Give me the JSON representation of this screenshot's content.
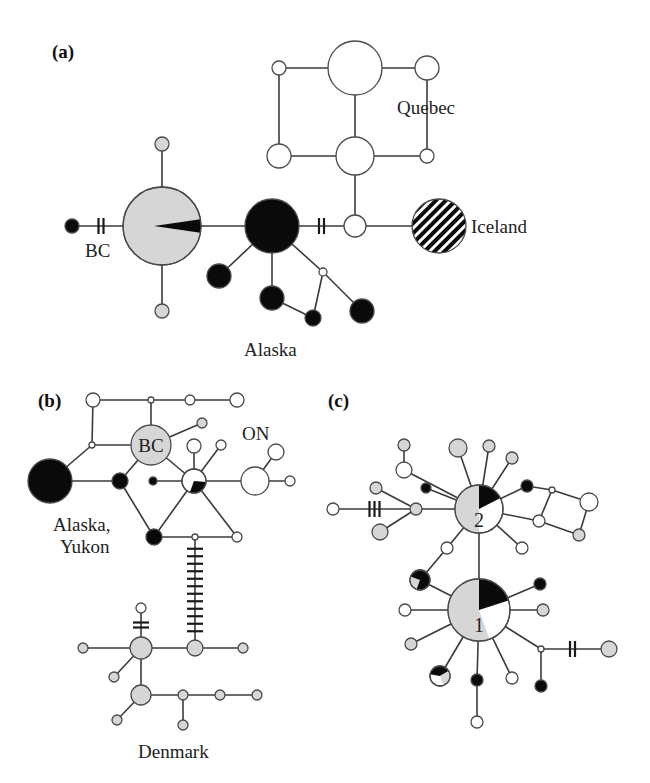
{
  "colors": {
    "white": "#ffffff",
    "gray": "#d6d6d6",
    "black": "#0a0a0a"
  },
  "panels": [
    {
      "id": "a",
      "label": "(a)",
      "region_labels": [
        "BC",
        "Quebec",
        "Iceland",
        "Alaska"
      ],
      "nodes": [
        {
          "id": "a1",
          "x": 162,
          "y": 226,
          "r": 39,
          "fill": "gray",
          "pie": [
            {
              "from": 80,
              "to": 100,
              "fill": "black",
              "inner": true
            }
          ]
        },
        {
          "id": "a2",
          "x": 72,
          "y": 226,
          "r": 7,
          "fill": "black"
        },
        {
          "id": "a3",
          "x": 162,
          "y": 144,
          "r": 7,
          "fill": "gray"
        },
        {
          "id": "a4",
          "x": 162,
          "y": 311,
          "r": 7,
          "fill": "gray"
        },
        {
          "id": "a5",
          "x": 272,
          "y": 226,
          "r": 27,
          "fill": "black"
        },
        {
          "id": "a6",
          "x": 219,
          "y": 276,
          "r": 12,
          "fill": "black"
        },
        {
          "id": "a7",
          "x": 272,
          "y": 298,
          "r": 12,
          "fill": "black"
        },
        {
          "id": "a8",
          "x": 313,
          "y": 318,
          "r": 8,
          "fill": "black"
        },
        {
          "id": "a9",
          "x": 323,
          "y": 272,
          "r": 4,
          "fill": "white"
        },
        {
          "id": "a10",
          "x": 362,
          "y": 311,
          "r": 12,
          "fill": "black"
        },
        {
          "id": "a11",
          "x": 355,
          "y": 226,
          "r": 11,
          "fill": "white"
        },
        {
          "id": "a12",
          "x": 439,
          "y": 226,
          "r": 27,
          "fill": "hatch"
        },
        {
          "id": "a13",
          "x": 355,
          "y": 156,
          "r": 19,
          "fill": "white"
        },
        {
          "id": "a14",
          "x": 355,
          "y": 68,
          "r": 27,
          "fill": "white"
        },
        {
          "id": "a15",
          "x": 279,
          "y": 68,
          "r": 7,
          "fill": "white"
        },
        {
          "id": "a16",
          "x": 427,
          "y": 68,
          "r": 12,
          "fill": "white"
        },
        {
          "id": "a17",
          "x": 279,
          "y": 156,
          "r": 12,
          "fill": "white"
        },
        {
          "id": "a18",
          "x": 427,
          "y": 156,
          "r": 7,
          "fill": "white"
        }
      ],
      "edges": [
        [
          "a2",
          "a1",
          2
        ],
        [
          "a1",
          "a3",
          0
        ],
        [
          "a1",
          "a4",
          0
        ],
        [
          "a1",
          "a5",
          0
        ],
        [
          "a5",
          "a11",
          2
        ],
        [
          "a11",
          "a12",
          0
        ],
        [
          "a11",
          "a13",
          0
        ],
        [
          "a13",
          "a14",
          0
        ],
        [
          "a14",
          "a15",
          0
        ],
        [
          "a14",
          "a16",
          0
        ],
        [
          "a15",
          "a17",
          0
        ],
        [
          "a17",
          "a13",
          0
        ],
        [
          "a13",
          "a18",
          0
        ],
        [
          "a18",
          "a16",
          0
        ],
        [
          "a5",
          "a6",
          0
        ],
        [
          "a5",
          "a7",
          0
        ],
        [
          "a7",
          "a8",
          0
        ],
        [
          "a8",
          "a9",
          0
        ],
        [
          "a5",
          "a9",
          0
        ],
        [
          "a9",
          "a10",
          0
        ]
      ]
    },
    {
      "id": "b",
      "label": "(b)",
      "region_labels": [
        "BC",
        "ON",
        "Alaska,",
        "Yukon",
        "Denmark"
      ],
      "nodes": [
        {
          "id": "b1",
          "x": 151,
          "y": 445,
          "r": 20,
          "fill": "gray"
        },
        {
          "id": "b2",
          "x": 50,
          "y": 481,
          "r": 22,
          "fill": "black"
        },
        {
          "id": "b3",
          "x": 93,
          "y": 400,
          "r": 7,
          "fill": "white"
        },
        {
          "id": "b4",
          "x": 151,
          "y": 400,
          "r": 3,
          "fill": "white"
        },
        {
          "id": "b5",
          "x": 190,
          "y": 400,
          "r": 5,
          "fill": "white"
        },
        {
          "id": "b6",
          "x": 237,
          "y": 400,
          "r": 7,
          "fill": "white"
        },
        {
          "id": "b7",
          "x": 92,
          "y": 445,
          "r": 3,
          "fill": "white"
        },
        {
          "id": "b8",
          "x": 202,
          "y": 423,
          "r": 5,
          "fill": "gray"
        },
        {
          "id": "b9",
          "x": 120,
          "y": 481,
          "r": 8,
          "fill": "black"
        },
        {
          "id": "b10",
          "x": 153,
          "y": 481,
          "r": 4,
          "fill": "black"
        },
        {
          "id": "b11",
          "x": 194,
          "y": 481,
          "r": 12,
          "fill": "white",
          "pie": [
            {
              "from": 95,
              "to": 200,
              "fill": "black"
            }
          ]
        },
        {
          "id": "b12",
          "x": 194,
          "y": 446,
          "r": 7,
          "fill": "white"
        },
        {
          "id": "b13",
          "x": 221,
          "y": 445,
          "r": 5,
          "fill": "white"
        },
        {
          "id": "b14",
          "x": 255,
          "y": 481,
          "r": 14,
          "fill": "white"
        },
        {
          "id": "b15",
          "x": 276,
          "y": 452,
          "r": 8,
          "fill": "white"
        },
        {
          "id": "b16",
          "x": 290,
          "y": 481,
          "r": 5,
          "fill": "white"
        },
        {
          "id": "b17",
          "x": 154,
          "y": 537,
          "r": 8,
          "fill": "black"
        },
        {
          "id": "b18",
          "x": 195,
          "y": 537,
          "r": 3,
          "fill": "white"
        },
        {
          "id": "b19",
          "x": 237,
          "y": 537,
          "r": 5,
          "fill": "white"
        },
        {
          "id": "b20",
          "x": 195,
          "y": 648,
          "r": 8,
          "fill": "gray"
        },
        {
          "id": "b21",
          "x": 141,
          "y": 648,
          "r": 11,
          "fill": "gray"
        },
        {
          "id": "b22",
          "x": 141,
          "y": 608,
          "r": 5,
          "fill": "white"
        },
        {
          "id": "b23",
          "x": 83,
          "y": 648,
          "r": 5,
          "fill": "gray"
        },
        {
          "id": "b24",
          "x": 243,
          "y": 648,
          "r": 5,
          "fill": "gray"
        },
        {
          "id": "b25",
          "x": 114,
          "y": 677,
          "r": 5,
          "fill": "gray"
        },
        {
          "id": "b26",
          "x": 141,
          "y": 695,
          "r": 10,
          "fill": "gray"
        },
        {
          "id": "b27",
          "x": 183,
          "y": 695,
          "r": 5,
          "fill": "gray"
        },
        {
          "id": "b28",
          "x": 220,
          "y": 695,
          "r": 5,
          "fill": "gray"
        },
        {
          "id": "b29",
          "x": 257,
          "y": 695,
          "r": 5,
          "fill": "gray"
        },
        {
          "id": "b30",
          "x": 117,
          "y": 720,
          "r": 5,
          "fill": "gray"
        },
        {
          "id": "b31",
          "x": 183,
          "y": 725,
          "r": 5,
          "fill": "gray"
        }
      ],
      "edges": [
        [
          "b3",
          "b4",
          0
        ],
        [
          "b4",
          "b5",
          0
        ],
        [
          "b5",
          "b6",
          0
        ],
        [
          "b4",
          "b1",
          0
        ],
        [
          "b3",
          "b7",
          0
        ],
        [
          "b7",
          "b1",
          0
        ],
        [
          "b7",
          "b2",
          0
        ],
        [
          "b1",
          "b8",
          0
        ],
        [
          "b2",
          "b9",
          0
        ],
        [
          "b9",
          "b1",
          0
        ],
        [
          "b9",
          "b17",
          0
        ],
        [
          "b10",
          "b11",
          0
        ],
        [
          "b1",
          "b11",
          0
        ],
        [
          "b11",
          "b12",
          0
        ],
        [
          "b11",
          "b13",
          0
        ],
        [
          "b11",
          "b14",
          0
        ],
        [
          "b14",
          "b15",
          0
        ],
        [
          "b14",
          "b16",
          0
        ],
        [
          "b11",
          "b17",
          0
        ],
        [
          "b11",
          "b19",
          0
        ],
        [
          "b17",
          "b18",
          0
        ],
        [
          "b18",
          "b19",
          0
        ],
        [
          "b18",
          "b20",
          12
        ],
        [
          "b21",
          "b20",
          0
        ],
        [
          "b21",
          "b22",
          2
        ],
        [
          "b23",
          "b21",
          0
        ],
        [
          "b20",
          "b24",
          0
        ],
        [
          "b21",
          "b25",
          0
        ],
        [
          "b21",
          "b26",
          0
        ],
        [
          "b26",
          "b27",
          0
        ],
        [
          "b27",
          "b28",
          0
        ],
        [
          "b28",
          "b29",
          0
        ],
        [
          "b26",
          "b30",
          0
        ],
        [
          "b27",
          "b31",
          0
        ]
      ]
    },
    {
      "id": "c",
      "label": "(c)",
      "region_labels": [
        "2",
        "1"
      ],
      "nodes": [
        {
          "id": "c2",
          "x": 479,
          "y": 509,
          "r": 24,
          "fill": "white",
          "pie": [
            {
              "from": 180,
              "to": 360,
              "fill": "gray"
            },
            {
              "from": 0,
              "to": 63,
              "fill": "black"
            }
          ],
          "text": "2"
        },
        {
          "id": "c1",
          "x": 479,
          "y": 610,
          "r": 31,
          "fill": "white",
          "pie": [
            {
              "from": 160,
              "to": 360,
              "fill": "gray"
            },
            {
              "from": 0,
              "to": 72,
              "fill": "black"
            }
          ],
          "text": "1"
        },
        {
          "id": "c3",
          "x": 333,
          "y": 509,
          "r": 6,
          "fill": "white"
        },
        {
          "id": "c4",
          "x": 416,
          "y": 509,
          "r": 6,
          "fill": "gray"
        },
        {
          "id": "c5",
          "x": 376,
          "y": 488,
          "r": 6,
          "fill": "gray"
        },
        {
          "id": "c6",
          "x": 380,
          "y": 532,
          "r": 8,
          "fill": "gray"
        },
        {
          "id": "c7",
          "x": 426,
          "y": 488,
          "r": 5,
          "fill": "black"
        },
        {
          "id": "c8",
          "x": 404,
          "y": 470,
          "r": 8,
          "fill": "white"
        },
        {
          "id": "c9",
          "x": 404,
          "y": 445,
          "r": 6,
          "fill": "gray"
        },
        {
          "id": "c10",
          "x": 458,
          "y": 448,
          "r": 9,
          "fill": "gray"
        },
        {
          "id": "c11",
          "x": 489,
          "y": 446,
          "r": 6,
          "fill": "gray"
        },
        {
          "id": "c12",
          "x": 512,
          "y": 458,
          "r": 6,
          "fill": "gray"
        },
        {
          "id": "c13",
          "x": 527,
          "y": 486,
          "r": 6,
          "fill": "black"
        },
        {
          "id": "c14",
          "x": 552,
          "y": 490,
          "r": 3,
          "fill": "white"
        },
        {
          "id": "c15",
          "x": 589,
          "y": 502,
          "r": 9,
          "fill": "white"
        },
        {
          "id": "c16",
          "x": 539,
          "y": 521,
          "r": 6,
          "fill": "white"
        },
        {
          "id": "c17",
          "x": 579,
          "y": 535,
          "r": 6,
          "fill": "gray"
        },
        {
          "id": "c18",
          "x": 522,
          "y": 548,
          "r": 6,
          "fill": "white"
        },
        {
          "id": "c19",
          "x": 447,
          "y": 548,
          "r": 6,
          "fill": "white"
        },
        {
          "id": "c20",
          "x": 420,
          "y": 580,
          "r": 10,
          "fill": "black",
          "pie": [
            {
              "from": 200,
              "to": 290,
              "fill": "gray"
            }
          ]
        },
        {
          "id": "c21",
          "x": 540,
          "y": 584,
          "r": 6,
          "fill": "black"
        },
        {
          "id": "c22",
          "x": 405,
          "y": 610,
          "r": 6,
          "fill": "white"
        },
        {
          "id": "c23",
          "x": 543,
          "y": 610,
          "r": 6,
          "fill": "gray"
        },
        {
          "id": "c24",
          "x": 411,
          "y": 644,
          "r": 6,
          "fill": "gray"
        },
        {
          "id": "c25",
          "x": 440,
          "y": 676,
          "r": 10,
          "fill": "white",
          "pie": [
            {
              "from": 280,
              "to": 60,
              "fill": "black"
            },
            {
              "from": 60,
              "to": 160,
              "fill": "gray"
            }
          ]
        },
        {
          "id": "c26",
          "x": 477,
          "y": 680,
          "r": 6,
          "fill": "black"
        },
        {
          "id": "c27",
          "x": 512,
          "y": 678,
          "r": 6,
          "fill": "white"
        },
        {
          "id": "c28",
          "x": 541,
          "y": 649,
          "r": 3,
          "fill": "white"
        },
        {
          "id": "c29",
          "x": 609,
          "y": 649,
          "r": 8,
          "fill": "gray"
        },
        {
          "id": "c30",
          "x": 541,
          "y": 686,
          "r": 6,
          "fill": "black"
        },
        {
          "id": "c31",
          "x": 477,
          "y": 722,
          "r": 6,
          "fill": "white"
        }
      ],
      "edges": [
        [
          "c3",
          "c4",
          3
        ],
        [
          "c4",
          "c2",
          0
        ],
        [
          "c4",
          "c5",
          0
        ],
        [
          "c4",
          "c6",
          0
        ],
        [
          "c7",
          "c2",
          0
        ],
        [
          "c8",
          "c2",
          0
        ],
        [
          "c8",
          "c9",
          0
        ],
        [
          "c10",
          "c2",
          0
        ],
        [
          "c11",
          "c2",
          0
        ],
        [
          "c12",
          "c2",
          0
        ],
        [
          "c13",
          "c2",
          0
        ],
        [
          "c13",
          "c14",
          0
        ],
        [
          "c14",
          "c15",
          0
        ],
        [
          "c14",
          "c16",
          0
        ],
        [
          "c16",
          "c2",
          0
        ],
        [
          "c16",
          "c17",
          0
        ],
        [
          "c17",
          "c15",
          0
        ],
        [
          "c18",
          "c2",
          0
        ],
        [
          "c19",
          "c2",
          0
        ],
        [
          "c19",
          "c20",
          0
        ],
        [
          "c2",
          "c1",
          0
        ],
        [
          "c20",
          "c1",
          0
        ],
        [
          "c21",
          "c1",
          0
        ],
        [
          "c22",
          "c1",
          0
        ],
        [
          "c23",
          "c1",
          0
        ],
        [
          "c24",
          "c1",
          0
        ],
        [
          "c25",
          "c1",
          0
        ],
        [
          "c26",
          "c1",
          0
        ],
        [
          "c26",
          "c31",
          0
        ],
        [
          "c27",
          "c1",
          0
        ],
        [
          "c28",
          "c1",
          0
        ],
        [
          "c28",
          "c29",
          2
        ],
        [
          "c28",
          "c30",
          0
        ]
      ]
    }
  ],
  "labels": [
    {
      "text": "(a)",
      "x": 52,
      "y": 58,
      "cls": "plbl",
      "name": "panel-a-label"
    },
    {
      "text": "Quebec",
      "x": 397,
      "y": 114,
      "cls": "lbl",
      "name": "label-quebec"
    },
    {
      "text": "Iceland",
      "x": 471,
      "y": 233,
      "cls": "lbl",
      "name": "label-iceland"
    },
    {
      "text": "BC",
      "x": 85,
      "y": 257,
      "cls": "lbl",
      "name": "label-bc-a"
    },
    {
      "text": "Alaska",
      "x": 244,
      "y": 356,
      "cls": "lbl",
      "name": "label-alaska"
    },
    {
      "text": "(b)",
      "x": 38,
      "y": 407,
      "cls": "plbl",
      "name": "panel-b-label"
    },
    {
      "text": "BC",
      "x": 151,
      "y": 452,
      "cls": "lbl",
      "anchor": "middle",
      "name": "label-bc-b"
    },
    {
      "text": "ON",
      "x": 242,
      "y": 440,
      "cls": "lbl",
      "name": "label-on"
    },
    {
      "text": "Alaska,",
      "x": 53,
      "y": 531,
      "cls": "lbl",
      "name": "label-alaska-yukon-1"
    },
    {
      "text": "Yukon",
      "x": 60,
      "y": 553,
      "cls": "lbl",
      "name": "label-alaska-yukon-2"
    },
    {
      "text": "Denmark",
      "x": 138,
      "y": 758,
      "cls": "lbl",
      "name": "label-denmark"
    },
    {
      "text": "(c)",
      "x": 328,
      "y": 407,
      "cls": "plbl",
      "name": "panel-c-label"
    }
  ]
}
